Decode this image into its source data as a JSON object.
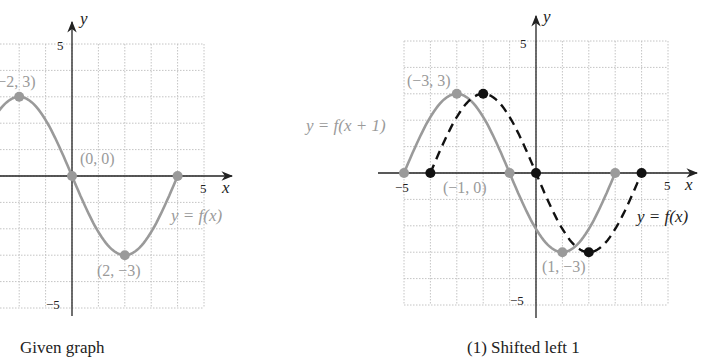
{
  "colors": {
    "grid": "#bdbdbd",
    "axis": "#222222",
    "gray_curve": "#999999",
    "dashed_curve": "#111111",
    "label_gray": "#9a9a9a"
  },
  "panels": [
    {
      "caption": "Given graph",
      "axis_labels": {
        "x": "x",
        "y": "y"
      },
      "ticks": {
        "x_pos": "5",
        "y_pos": "5",
        "y_neg": "−5"
      },
      "curve_label": "y = f(x)",
      "point_labels": [
        "(−2, 3)",
        "(0, 0)",
        "(2, −3)"
      ]
    },
    {
      "caption": "(1) Shifted left 1",
      "axis_labels": {
        "x": "x",
        "y": "y"
      },
      "ticks": {
        "x_pos": "5",
        "x_neg": "−5",
        "y_pos": "5",
        "y_neg": "−5"
      },
      "shifted_label": "y = f(x + 1)",
      "original_label": "y = f(x)",
      "point_labels": [
        "(−3, 3)",
        "(−1, 0)",
        "(1, −3)"
      ]
    }
  ],
  "chart_data": [
    {
      "type": "line",
      "title": "Given graph",
      "xlabel": "x",
      "ylabel": "y",
      "xlim": [
        -5,
        5
      ],
      "ylim": [
        -5,
        5
      ],
      "grid": true,
      "series": [
        {
          "name": "y = f(x)",
          "style": "solid gray",
          "x": [
            -4,
            -2,
            0,
            2,
            4
          ],
          "y": [
            0,
            3,
            0,
            -3,
            0
          ]
        }
      ],
      "annotations": [
        "(-2, 3)",
        "(0, 0)",
        "(2, -3)"
      ]
    },
    {
      "type": "line",
      "title": "(1) Shifted left 1",
      "xlabel": "x",
      "ylabel": "y",
      "xlim": [
        -5,
        5
      ],
      "ylim": [
        -5,
        5
      ],
      "grid": true,
      "series": [
        {
          "name": "y = f(x + 1)",
          "style": "solid gray",
          "x": [
            -5,
            -3,
            -1,
            1,
            3
          ],
          "y": [
            0,
            3,
            0,
            -3,
            0
          ]
        },
        {
          "name": "y = f(x)",
          "style": "dashed black",
          "x": [
            -4,
            -2,
            0,
            2,
            4
          ],
          "y": [
            0,
            3,
            0,
            -3,
            0
          ]
        }
      ],
      "annotations": [
        "(-3, 3)",
        "(-1, 0)",
        "(1, -3)"
      ]
    }
  ]
}
